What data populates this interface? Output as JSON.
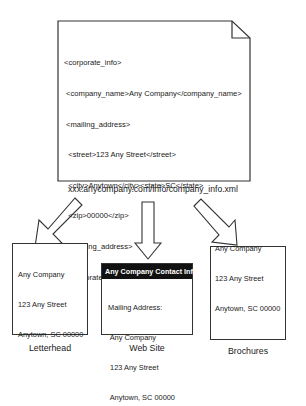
{
  "xml_document": {
    "lines": [
      "<corporate_info>",
      " <company_name>Any Company</company_name>",
      " <mailing_address>",
      "  <street>123 Any Street</street>",
      "  <city>Anytown</city><state>SC</state>",
      "  <zip>00000</zip>",
      " </mailing_address>",
      "</corporate_info>"
    ],
    "url": "xxx.anycompany.com/info/company_info.xml"
  },
  "outputs": {
    "letterhead": {
      "address": [
        "Any Company",
        "123 Any Street",
        "Anytown, SC 00000"
      ],
      "caption": "Letterhead"
    },
    "website": {
      "header": "Any Company Contact Info",
      "label": "Mailing Address:",
      "address": [
        " Any Company",
        " 123 Any Street",
        " Anytown, SC 00000"
      ],
      "caption": "Web Site"
    },
    "brochures": {
      "address": [
        "Any Company",
        "123 Any Street",
        "Anytown, SC 00000"
      ],
      "caption": "Brochures"
    }
  },
  "arrows": [
    {
      "name": "arrow-to-letterhead",
      "direction": "down-left"
    },
    {
      "name": "arrow-to-website",
      "direction": "down"
    },
    {
      "name": "arrow-to-brochures",
      "direction": "down-right"
    }
  ]
}
